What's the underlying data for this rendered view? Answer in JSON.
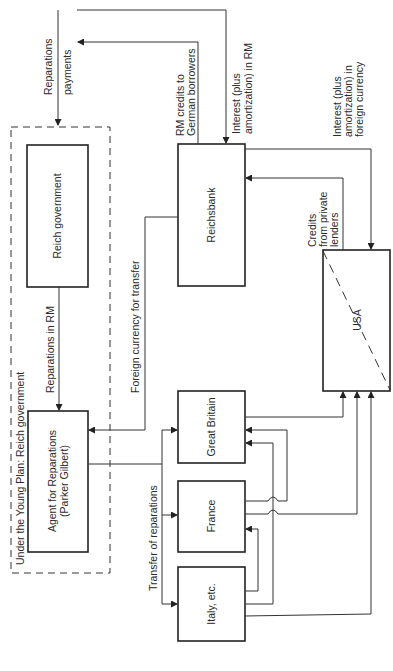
{
  "diagram": {
    "orientation": "rotated 90° counter-clockwise",
    "nodes": {
      "reich_government": "Reich government",
      "agent_for_reparations_line1": "Agent for Reparations",
      "agent_for_reparations_line2": "(Parker Gilbert)",
      "reichsbank": "Reichsbank",
      "usa": "USA",
      "great_britain": "Great Britain",
      "france": "France",
      "italy": "Italy, etc."
    },
    "group": {
      "young_plan_label": "Under the Young Plan: Reich government"
    },
    "edge_labels": {
      "reparations_payments_line1": "Reparations",
      "reparations_payments_line2": "payments",
      "rm_credits_line1": "RM credits to",
      "rm_credits_line2": "German borrowers",
      "interest_rm_line1": "Interest (plus",
      "interest_rm_line2": "amortization) in RM",
      "interest_fc_line1": "Interest (plus",
      "interest_fc_line2": "amortization) in",
      "interest_fc_line3": "foreign currency",
      "credits_private_line1": "Credits",
      "credits_private_line2": "from private",
      "credits_private_line3": "lenders",
      "reparations_in_rm": "Reparations in RM",
      "foreign_currency_transfer": "Foreign currency for transfer",
      "transfer_of_reparations": "Transfer of reparations"
    },
    "edges": [
      {
        "from": "top (Allies)",
        "to": "Young Plan group",
        "label": "Reparations payments"
      },
      {
        "from": "Reichsbank",
        "to": "top (German borrowers)",
        "label": "RM credits to German borrowers"
      },
      {
        "from": "top (German borrowers)",
        "to": "Reichsbank",
        "label": "Interest (plus amortization) in RM"
      },
      {
        "from": "Reichsbank",
        "to": "USA",
        "label": "Interest (plus amortization) in foreign currency"
      },
      {
        "from": "USA",
        "to": "Reichsbank",
        "label": "Credits from private lenders"
      },
      {
        "from": "Reich government",
        "to": "Agent for Reparations",
        "label": "Reparations in RM"
      },
      {
        "from": "Reichsbank",
        "to": "Agent for Reparations",
        "label": "Foreign currency for transfer"
      },
      {
        "from": "Agent for Reparations",
        "to": "Great Britain / France / Italy",
        "label": "Transfer of reparations"
      },
      {
        "from": "Great Britain",
        "to": "USA",
        "label": ""
      },
      {
        "from": "France",
        "to": "Great Britain",
        "label": ""
      },
      {
        "from": "France",
        "to": "USA",
        "label": ""
      },
      {
        "from": "Italy, etc.",
        "to": "France",
        "label": ""
      },
      {
        "from": "Italy, etc.",
        "to": "Great Britain",
        "label": ""
      },
      {
        "from": "Italy, etc.",
        "to": "USA",
        "label": ""
      }
    ]
  }
}
